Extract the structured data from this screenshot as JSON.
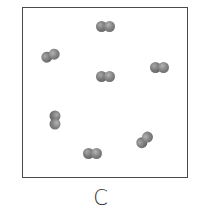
{
  "figure": {
    "label": "C",
    "colors": {
      "border": "#4a4a4a",
      "atom": "#7a7a7a",
      "background": "#ffffff"
    },
    "molecules": [
      {
        "id": 1,
        "cx": 106,
        "cy": 26,
        "angle": 0
      },
      {
        "id": 2,
        "cx": 51,
        "cy": 55,
        "angle": -22
      },
      {
        "id": 3,
        "cx": 106,
        "cy": 76,
        "angle": 0
      },
      {
        "id": 4,
        "cx": 160,
        "cy": 67,
        "angle": 0
      },
      {
        "id": 5,
        "cx": 55,
        "cy": 120,
        "angle": 90
      },
      {
        "id": 6,
        "cx": 145,
        "cy": 139,
        "angle": -45
      },
      {
        "id": 7,
        "cx": 93,
        "cy": 153,
        "angle": 0
      }
    ]
  }
}
